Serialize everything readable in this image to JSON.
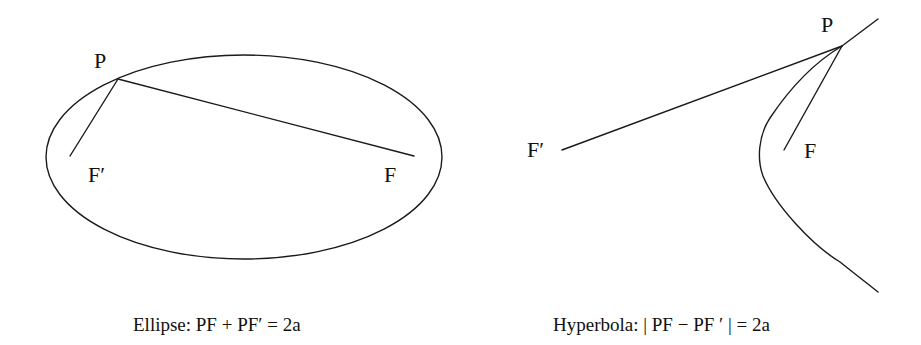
{
  "diagram": {
    "stroke_color": "#1a1a1a",
    "background": "#ffffff",
    "ellipse": {
      "labels": {
        "P": "P",
        "F_prime": "F′",
        "F": "F"
      },
      "caption": "Ellipse: PF + PF′ = 2a"
    },
    "hyperbola": {
      "labels": {
        "P": "P",
        "F_prime": "F′",
        "F": "F"
      },
      "caption": "Hyperbola: | PF − PF ′ | = 2a"
    }
  }
}
